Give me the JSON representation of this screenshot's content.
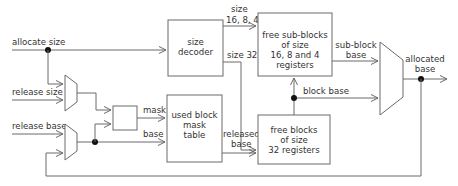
{
  "diagram": {
    "inputs": {
      "allocate_size": "allocate size",
      "release_size": "release size",
      "release_base": "release base"
    },
    "blocks": {
      "size_decoder": [
        "size",
        "decoder"
      ],
      "free_sub_blocks": [
        "free sub-blocks",
        "of size",
        "16, 8 and 4",
        "registers"
      ],
      "used_block_mask_table": [
        "used block",
        "mask",
        "table"
      ],
      "free_blocks": [
        "free blocks",
        "of size",
        "32 registers"
      ]
    },
    "signals": {
      "size_small": [
        "size",
        "16, 8, 4"
      ],
      "size_32": "size 32",
      "mask": "mask",
      "base": "base",
      "released_base": [
        "released",
        "base"
      ],
      "sub_block_base": [
        "sub-block",
        "base"
      ],
      "block_base": "block base"
    },
    "outputs": {
      "allocated_base": [
        "allocated",
        "base"
      ]
    },
    "colors": {
      "line": "#6a6a6a",
      "text": "#333333",
      "junction": "#111111",
      "background": "#ffffff"
    }
  }
}
